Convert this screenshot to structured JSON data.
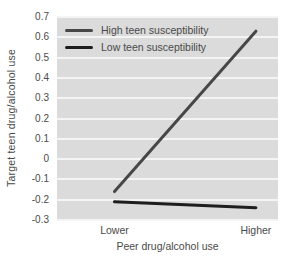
{
  "chart_data": {
    "type": "line",
    "title": "",
    "categories": [
      "Lower",
      "Higher"
    ],
    "series": [
      {
        "name": "High teen susceptibility",
        "values": [
          -0.16,
          0.63
        ],
        "color": "#474747"
      },
      {
        "name": "Low teen susceptibility",
        "values": [
          -0.21,
          -0.24
        ],
        "color": "#1d1d1d"
      }
    ],
    "xlabel": "Peer drug/alcohol use",
    "ylabel": "Target teen drug/alcohol use",
    "ylim": [
      -0.3,
      0.7
    ],
    "yticks": [
      "0.7",
      "0.6",
      "0.5",
      "0.4",
      "0.3",
      "0.2",
      "0.1",
      "0",
      "-0.1",
      "-0.2",
      "-0.3"
    ],
    "x_fractions": [
      0.26,
      0.9
    ],
    "grid": "horizontal",
    "legend_position": "top-left",
    "plot_bg": "#dbdbdb",
    "grid_color": "#f4f4f4",
    "text_color": "#4a4a4a",
    "line_width": 3
  }
}
